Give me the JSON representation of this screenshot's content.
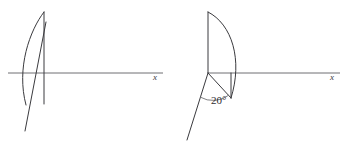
{
  "figure": {
    "background_color": "#ffffff",
    "stroke_color": "#3a3a3e",
    "axis_color": "#6f6f73",
    "panels": [
      {
        "id": "left-panel",
        "name": "upright-lamina-diagram",
        "axis_label": "x",
        "angle_label": null,
        "description": "Vertical lamina bounded by a straight edge and a curved edge crossing the x-axis"
      },
      {
        "id": "right-panel",
        "name": "tilted-lamina-diagram",
        "axis_label": "x",
        "angle_label": "20°",
        "description": "Lamina with curved edge tilted so its base makes a 20 degree angle"
      }
    ]
  },
  "left": {
    "axis_label": "x",
    "axis": {
      "x1": 8,
      "y1": 73,
      "x2": 163,
      "y2": 73
    },
    "vertical_edge": {
      "x1": 44,
      "y1": 12,
      "x2": 44,
      "y2": 104
    },
    "curve": {
      "start_x": 44,
      "start_y": 12,
      "ctrl_x": 15,
      "ctrl_y": 60,
      "end_x": 26,
      "end_y": 105
    },
    "slant_line": {
      "x1": 25,
      "y1": 131,
      "x2": 46,
      "y2": 22
    },
    "label_pos": {
      "x": 155,
      "y": 80
    }
  },
  "right": {
    "axis_label": "x",
    "angle_label": "20°",
    "angle_value": 20,
    "axis": {
      "x1": 208,
      "y1": 73,
      "x2": 340,
      "y2": 73
    },
    "vertical_edge": {
      "x1": 208,
      "y1": 12,
      "x2": 208,
      "y2": 73
    },
    "curve": {
      "start_x": 208,
      "start_y": 12,
      "ctrl_x": 242,
      "ctrl_y": 52,
      "end_x": 231,
      "end_y": 98
    },
    "base_line": {
      "x1": 208,
      "y1": 73,
      "x2": 231,
      "y2": 98
    },
    "right_edge": {
      "x1": 231,
      "y1": 73,
      "x2": 231,
      "y2": 98
    },
    "slant_line": {
      "x1": 208,
      "y1": 73,
      "x2": 187,
      "y2": 140
    },
    "angle_arc": {
      "cx": 208,
      "cy": 73,
      "r": 26
    },
    "angle_label_pos": {
      "x": 211,
      "y": 104
    },
    "label_pos": {
      "x": 332,
      "y": 80
    }
  }
}
